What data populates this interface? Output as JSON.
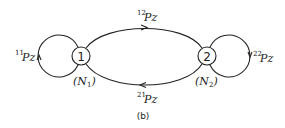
{
  "figure": {
    "caption": "(b)",
    "nodes": [
      {
        "id": "1",
        "label": "1",
        "name_label": "(N",
        "name_sub": "1",
        "name_close": ")"
      },
      {
        "id": "2",
        "label": "2",
        "name_label": "(N",
        "name_sub": "2",
        "name_close": ")"
      }
    ],
    "edges": [
      {
        "from": "1",
        "to": "1",
        "sup": "11",
        "label": "Pz"
      },
      {
        "from": "1",
        "to": "2",
        "sup": "12",
        "label": "Pz"
      },
      {
        "from": "2",
        "to": "1",
        "sup": "21",
        "label": "Pz"
      },
      {
        "from": "2",
        "to": "2",
        "sup": "22",
        "label": "Pz"
      }
    ],
    "colors": {
      "stroke": "#222222",
      "background": "#ffffff"
    }
  }
}
